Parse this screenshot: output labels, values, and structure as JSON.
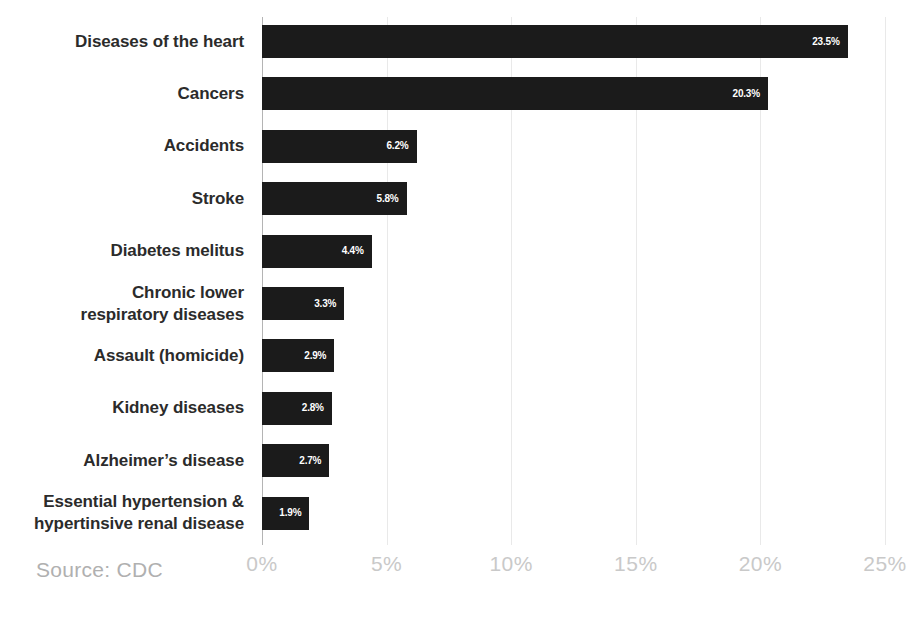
{
  "chart_data": {
    "type": "bar",
    "orientation": "horizontal",
    "title": "",
    "subtitle": "",
    "xlabel": "",
    "ylabel": "",
    "xlim": [
      0,
      25
    ],
    "grid": true,
    "legend": null,
    "categories": [
      "Diseases of the heart",
      "Cancers",
      "Accidents",
      "Stroke",
      "Diabetes melitus",
      "Chronic lower\nrespiratory diseases",
      "Assault (homicide)",
      "Kidney diseases",
      "Alzheimer's disease",
      "Essential hypertension &\nhypertinsive renal disease"
    ],
    "values": [
      23.5,
      20.3,
      6.2,
      5.8,
      4.4,
      3.3,
      2.9,
      2.8,
      2.7,
      1.9
    ],
    "value_labels": [
      "23.5%",
      "20.3%",
      "6.2%",
      "5.8%",
      "4.4%",
      "3.3%",
      "2.9%",
      "2.8%",
      "2.7%",
      "1.9%"
    ],
    "xticks": [
      0,
      5,
      10,
      15,
      20,
      25
    ],
    "xtick_labels": [
      "0%",
      "5%",
      "10%",
      "15%",
      "20%",
      "25%"
    ],
    "bar_color": "#1b1b1b",
    "value_label_color": "#ffffff",
    "gridline_color": "#e9e9e9",
    "axis_color": "#b4b4b4",
    "category_label_color": "#2b2b2b",
    "tick_label_color": "#c9c9c9"
  },
  "rows": [
    {
      "label_line1": "Diseases of the heart",
      "label_line2": "",
      "value_label": "23.5%",
      "value": 23.5
    },
    {
      "label_line1": "Cancers",
      "label_line2": "",
      "value_label": "20.3%",
      "value": 20.3
    },
    {
      "label_line1": "Accidents",
      "label_line2": "",
      "value_label": "6.2%",
      "value": 6.2
    },
    {
      "label_line1": "Stroke",
      "label_line2": "",
      "value_label": "5.8%",
      "value": 5.8
    },
    {
      "label_line1": "Diabetes melitus",
      "label_line2": "",
      "value_label": "4.4%",
      "value": 4.4
    },
    {
      "label_line1": "Chronic lower",
      "label_line2": "respiratory diseases",
      "value_label": "3.3%",
      "value": 3.3
    },
    {
      "label_line1": "Assault (homicide)",
      "label_line2": "",
      "value_label": "2.9%",
      "value": 2.9
    },
    {
      "label_line1": "Kidney diseases",
      "label_line2": "",
      "value_label": "2.8%",
      "value": 2.8
    },
    {
      "label_line1": "Alzheimer’s disease",
      "label_line2": "",
      "value_label": "2.7%",
      "value": 2.7
    },
    {
      "label_line1": "Essential hypertension &",
      "label_line2": "hypertinsive renal disease",
      "value_label": "1.9%",
      "value": 1.9
    }
  ],
  "xticks": [
    {
      "label": "0%",
      "value": 0
    },
    {
      "label": "5%",
      "value": 5
    },
    {
      "label": "10%",
      "value": 10
    },
    {
      "label": "15%",
      "value": 15
    },
    {
      "label": "20%",
      "value": 20
    },
    {
      "label": "25%",
      "value": 25
    }
  ],
  "footer": {
    "source": "Source: CDC"
  }
}
